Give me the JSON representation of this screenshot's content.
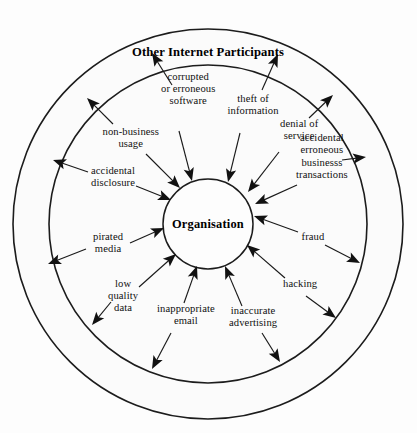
{
  "diagram": {
    "title": "Other Internet Participants",
    "center_label": "Organisation",
    "colors": {
      "stroke": "#1c1c1c",
      "ring_fill": "#fbfbfb",
      "background": "#fdfdfd",
      "text": "#101010"
    },
    "geometry": {
      "center_x": 208,
      "center_y": 224,
      "outer_radius": 195,
      "middle_radius": 159,
      "inner_radius": 45
    },
    "threats": [
      {
        "id": "corrupted-or-erroneous-software",
        "lines": [
          "corrupted",
          "or erroneous",
          "software"
        ],
        "label_x": 188,
        "label_y": 89,
        "inward_from_x": 179,
        "inward_from_y": 131,
        "inward_to_x": 192,
        "inward_to_y": 181,
        "outward_from_x": 172,
        "outward_from_y": 85,
        "outward_to_x": 152,
        "outward_to_y": 53
      },
      {
        "id": "theft-of-information",
        "lines": [
          "theft of",
          "information"
        ],
        "label_x": 253,
        "label_y": 105,
        "inward_from_x": 240,
        "inward_from_y": 133,
        "inward_to_x": 228,
        "inward_to_y": 182,
        "outward_from_x": 262,
        "outward_from_y": 90,
        "outward_to_x": 278,
        "outward_to_y": 54
      },
      {
        "id": "denial-of-service",
        "lines": [
          "denial of",
          "service"
        ],
        "label_x": 299,
        "label_y": 130,
        "inward_from_x": 279,
        "inward_from_y": 152,
        "inward_to_x": 248,
        "inward_to_y": 192,
        "outward_from_x": 309,
        "outward_from_y": 118,
        "outward_to_x": 333,
        "outward_to_y": 95
      },
      {
        "id": "accidental-erroneous-businesss-transactions",
        "lines": [
          "accidental",
          "erroneous",
          "businesss",
          "transactions"
        ],
        "label_x": 322,
        "label_y": 157,
        "inward_from_x": 297,
        "inward_from_y": 185,
        "inward_to_x": 255,
        "inward_to_y": 204,
        "outward_from_x": 342,
        "outward_from_y": 160,
        "outward_to_x": 366,
        "outward_to_y": 157
      },
      {
        "id": "fraud",
        "lines": [
          "fraud"
        ],
        "label_x": 313,
        "label_y": 237,
        "inward_from_x": 298,
        "inward_from_y": 232,
        "inward_to_x": 254,
        "inward_to_y": 216,
        "outward_from_x": 325,
        "outward_from_y": 245,
        "outward_to_x": 360,
        "outward_to_y": 263
      },
      {
        "id": "hacking",
        "lines": [
          "hacking"
        ],
        "label_x": 300,
        "label_y": 284,
        "inward_from_x": 285,
        "inward_from_y": 278,
        "inward_to_x": 247,
        "inward_to_y": 245,
        "outward_from_x": 306,
        "outward_from_y": 296,
        "outward_to_x": 336,
        "outward_to_y": 318
      },
      {
        "id": "inaccurate-advertising",
        "lines": [
          "inaccurate",
          "advertising"
        ],
        "label_x": 253,
        "label_y": 317,
        "inward_from_x": 242,
        "inward_from_y": 306,
        "inward_to_x": 225,
        "inward_to_y": 266,
        "outward_from_x": 262,
        "outward_from_y": 333,
        "outward_to_x": 280,
        "outward_to_y": 362
      },
      {
        "id": "inappropriate-email",
        "lines": [
          "inappropriate",
          "email"
        ],
        "label_x": 186,
        "label_y": 315,
        "inward_from_x": 184,
        "inward_from_y": 303,
        "inward_to_x": 197,
        "inward_to_y": 266,
        "outward_from_x": 171,
        "outward_from_y": 333,
        "outward_to_x": 152,
        "outward_to_y": 369
      },
      {
        "id": "low-quality-data",
        "lines": [
          "low",
          "quality",
          "data"
        ],
        "label_x": 123,
        "label_y": 296,
        "inward_from_x": 139,
        "inward_from_y": 287,
        "inward_to_x": 176,
        "inward_to_y": 254,
        "outward_from_x": 111,
        "outward_from_y": 302,
        "outward_to_x": 92,
        "outward_to_y": 325
      },
      {
        "id": "pirated-media",
        "lines": [
          "pirated",
          "media"
        ],
        "label_x": 108,
        "label_y": 243,
        "inward_from_x": 130,
        "inward_from_y": 243,
        "inward_to_x": 164,
        "inward_to_y": 228,
        "outward_from_x": 86,
        "outward_from_y": 249,
        "outward_to_x": 48,
        "outward_to_y": 264
      },
      {
        "id": "accidental-disclosure",
        "lines": [
          "accidental",
          "disclosure"
        ],
        "label_x": 113,
        "label_y": 177,
        "inward_from_x": 136,
        "inward_from_y": 186,
        "inward_to_x": 171,
        "inward_to_y": 200,
        "outward_from_x": 88,
        "outward_from_y": 172,
        "outward_to_x": 53,
        "outward_to_y": 160
      },
      {
        "id": "non-business-usage",
        "lines": [
          "non-business",
          "usage"
        ],
        "label_x": 131,
        "label_y": 138,
        "inward_from_x": 146,
        "inward_from_y": 154,
        "inward_to_x": 180,
        "inward_to_y": 188,
        "outward_from_x": 113,
        "outward_from_y": 124,
        "outward_to_x": 87,
        "outward_to_y": 98
      }
    ]
  }
}
